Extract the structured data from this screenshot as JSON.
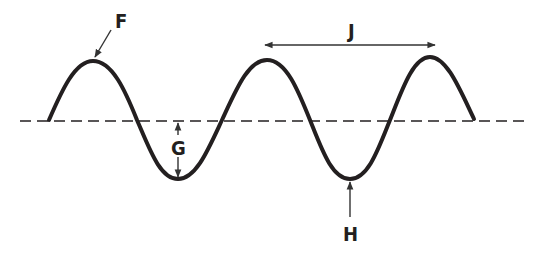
{
  "colors": {
    "wave": "#231f20",
    "baseline": "#231f20",
    "arrows": "#333333",
    "background": "#ffffff"
  },
  "labels": {
    "F": {
      "text": "F",
      "points_to": "crest"
    },
    "G": {
      "text": "G",
      "points_to": "amplitude (baseline to trough)"
    },
    "H": {
      "text": "H",
      "points_to": "trough"
    },
    "J": {
      "text": "J",
      "points_to": "wavelength (crest to crest)"
    }
  },
  "wave": {
    "start": [
      49,
      120
    ],
    "crests": [
      [
        93,
        61
      ],
      [
        267,
        60
      ],
      [
        430,
        57
      ]
    ],
    "troughs": [
      [
        178,
        179
      ],
      [
        350,
        179
      ]
    ],
    "end": [
      474,
      119
    ]
  },
  "baseline": {
    "y": 121,
    "x1": 20,
    "x2": 528,
    "style": "dashed"
  }
}
